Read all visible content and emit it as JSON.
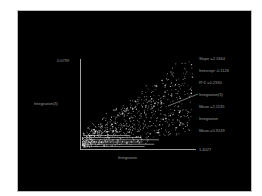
{
  "chart_data": {
    "type": "scatter",
    "title": "",
    "xlabel": "Integration",
    "ylabel": "Integration(3)",
    "x_max_label": "1.4027",
    "y_max_label": "0.0799",
    "grid": false,
    "background": "#000000",
    "point_color": "#e0e0e0",
    "annotations": [
      "Slope =2.1664",
      "Intercept -0.1126",
      "R^2 =0.2330",
      "Integration(3)",
      "Mean =2.1135",
      "Integration",
      "Mean =0.9249"
    ],
    "regression": {
      "slope": 2.1664,
      "intercept": -0.1126,
      "r2": 0.233
    },
    "means": {
      "integration3": 2.1135,
      "integration": 0.9249
    }
  }
}
